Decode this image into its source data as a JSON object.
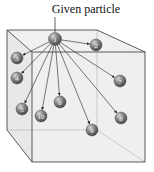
{
  "title": "Given particle",
  "colors": {
    "cube_fill": "#ededed",
    "cube_edge": "#4a4a4a",
    "particle": "#7a7a7a",
    "arrow": "#222222"
  },
  "source_particle": {
    "id": "1",
    "x": 55,
    "y": 39
  },
  "particles": [
    {
      "id": "2",
      "x": 96,
      "y": 45
    },
    {
      "id": "3",
      "x": 17,
      "y": 58
    },
    {
      "id": "4",
      "x": 17,
      "y": 78
    },
    {
      "id": "5",
      "x": 22,
      "y": 109
    },
    {
      "id": "6",
      "x": 60,
      "y": 102
    },
    {
      "id": "7",
      "x": 120,
      "y": 81
    },
    {
      "id": "8",
      "x": 121,
      "y": 118
    },
    {
      "id": "9",
      "x": 92,
      "y": 130
    },
    {
      "id": "10",
      "x": 41,
      "y": 116
    }
  ]
}
